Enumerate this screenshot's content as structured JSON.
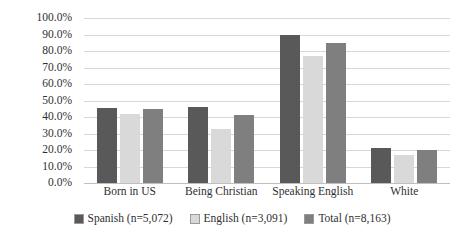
{
  "chart_data": {
    "type": "bar",
    "title": "",
    "subtitle": "",
    "xlabel": "",
    "ylabel": "",
    "categories": [
      "Born in US",
      "Being Christian",
      "Speaking English",
      "White"
    ],
    "series": [
      {
        "name": "Spanish (n=5,072)",
        "color": "#595959",
        "values": [
          45.5,
          46.0,
          89.5,
          21.0
        ]
      },
      {
        "name": "English (n=3,091)",
        "color": "#d9d9d9",
        "values": [
          42.0,
          33.0,
          77.0,
          17.0
        ]
      },
      {
        "name": "Total (n=8,163)",
        "color": "#7f7f7f",
        "values": [
          45.0,
          41.0,
          85.0,
          20.0
        ]
      }
    ],
    "ylim": [
      0,
      100
    ],
    "ytick_step": 10,
    "ytick_labels": [
      "100.0%",
      "90.0%",
      "80.0%",
      "70.0%",
      "60.0%",
      "50.0%",
      "40.0%",
      "30.0%",
      "20.0%",
      "10.0%",
      "0.0%"
    ],
    "ytick_values": [
      100,
      90,
      80,
      70,
      60,
      50,
      40,
      30,
      20,
      10,
      0
    ],
    "grid": true,
    "grid_axis": "y",
    "legend_position": "bottom",
    "value_format": "percent"
  }
}
